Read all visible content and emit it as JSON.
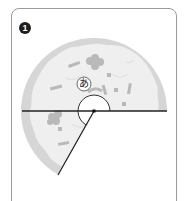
{
  "figure": {
    "step_number": "1",
    "angle_label": "あ",
    "colors": {
      "crust": "#d6d6d6",
      "cheese": "#efefef",
      "topping": "#b9b9b9",
      "line": "#222222",
      "card_border": "#9a9a9a",
      "badge": "#1e1e1e"
    }
  }
}
